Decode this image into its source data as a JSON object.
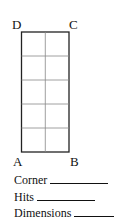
{
  "diagram": {
    "corners": {
      "top_left": "D",
      "top_right": "C",
      "bottom_left": "A",
      "bottom_right": "B"
    },
    "grid": {
      "columns": 2,
      "rows": 5
    }
  },
  "fields": [
    {
      "label": "Corner"
    },
    {
      "label": "Hits"
    },
    {
      "label": "Dimensions"
    }
  ]
}
